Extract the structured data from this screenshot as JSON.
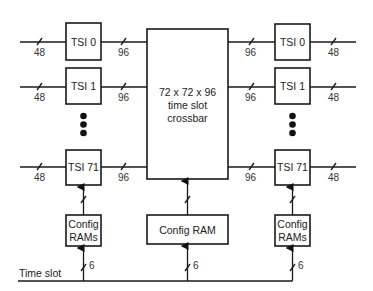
{
  "diagram": {
    "left_tsis": [
      {
        "label": "TSI 0",
        "in_width": "48",
        "out_width": "96"
      },
      {
        "label": "TSI 1",
        "in_width": "48",
        "out_width": "96"
      },
      {
        "label": "TSI 71",
        "in_width": "48",
        "out_width": "96"
      }
    ],
    "right_tsis": [
      {
        "label": "TSI 0",
        "in_width": "96",
        "out_width": "48"
      },
      {
        "label": "TSI 1",
        "in_width": "96",
        "out_width": "48"
      },
      {
        "label": "TSI 71",
        "in_width": "96",
        "out_width": "48"
      }
    ],
    "crossbar": {
      "line1": "72 x 72 x 96",
      "line2": "time slot",
      "line3": "crossbar"
    },
    "center_config": {
      "label": "Config RAM",
      "bus_width": "6"
    },
    "left_config": {
      "line1": "Config",
      "line2": "RAMs",
      "bus_width": "6"
    },
    "right_config": {
      "line1": "Config",
      "line2": "RAMs",
      "bus_width": "6"
    },
    "time_slot_label": "Time slot",
    "ellipsis_dots": 3
  }
}
